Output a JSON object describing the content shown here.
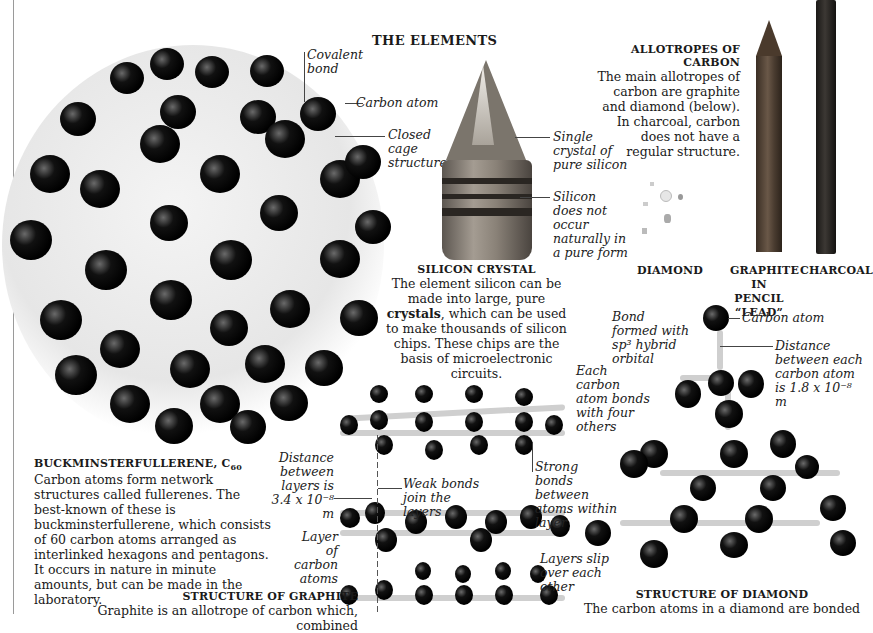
{
  "page": {
    "title": "THE ELEMENTS"
  },
  "buckyball": {
    "heading": "BUCKMINSTERFULLERENE, C",
    "heading_sub": "60",
    "body": "Carbon atoms form network structures called fullerenes. The best-known of these is buckminsterfullerene, which consists of 60 carbon atoms arranged as interlinked hexagons and pentagons. It occurs in nature in minute amounts, but can be made in the laboratory.",
    "labels": {
      "covalent_bond": "Covalent bond",
      "carbon_atom": "Carbon atom",
      "closed_cage": "Closed cage structure"
    }
  },
  "silicon": {
    "heading": "SILICON CRYSTAL",
    "body_pre": "The element silicon can be made into large, pure ",
    "body_bold": "crystals",
    "body_post": ", which can be used to make thousands of silicon chips. These chips are the basis of microelectronic circuits.",
    "labels": {
      "single_crystal": "Single crystal of pure silicon",
      "not_natural": "Silicon does not occur naturally in a pure form"
    }
  },
  "allotropes": {
    "heading": "ALLOTROPES OF CARBON",
    "body": "The main allotropes of carbon are graphite and diamond (below). In charcoal, carbon does not have a regular structure.",
    "items": [
      {
        "label": "DIAMOND"
      },
      {
        "label": "GRAPHITE IN PENCIL “LEAD”"
      },
      {
        "label": "CHARCOAL"
      }
    ]
  },
  "graphite": {
    "heading": "STRUCTURE OF GRAPHITE",
    "body": "Graphite is an allotrope of carbon which, combined",
    "labels": {
      "distance": "Distance between layers is 3.4 x 10⁻⁸ m",
      "weak_bonds": "Weak bonds join the layers",
      "strong_bonds": "Strong bonds between atoms within layer",
      "layer_atoms": "Layer of carbon atoms",
      "layers_slip": "Layers slip over each other"
    }
  },
  "diamond": {
    "heading": "STRUCTURE OF DIAMOND",
    "body": "The carbon atoms in a diamond are bonded",
    "labels": {
      "bond_sp3": "Bond formed with sp³ hybrid orbital",
      "carbon_atom": "Carbon atom",
      "distance": "Distance between each carbon atom is 1.8 x 10⁻⁸ m",
      "four_others": "Each carbon atom bonds with four others"
    }
  }
}
